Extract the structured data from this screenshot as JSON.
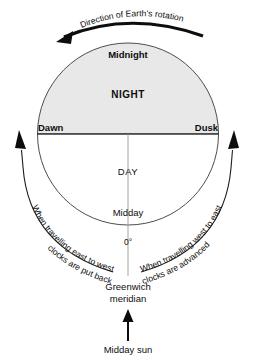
{
  "diagram": {
    "rotation_label": "Direction of Earth's rotation",
    "earth": {
      "night_region_label": "NIGHT",
      "day_region_label": "DAY",
      "midnight_label": "Midnight",
      "midday_label": "Midday",
      "dawn_label": "Dawn",
      "dusk_label": "Dusk",
      "longitude_label": "0°"
    },
    "meridian": {
      "line1": "Greenwich",
      "line2": "meridian"
    },
    "sun": {
      "label": "Midday sun"
    },
    "travel_west": {
      "line1": "When travelling east to west",
      "line2": "clocks are put back"
    },
    "travel_east": {
      "line1": "When travelling west to east",
      "line2": "clocks are advanced"
    },
    "colors": {
      "night_fill": "#e8e8e8",
      "outline": "#3a3a3a",
      "ink": "#0d0d0d",
      "meridian_line": "#9a9a9a",
      "background": "#ffffff"
    }
  }
}
